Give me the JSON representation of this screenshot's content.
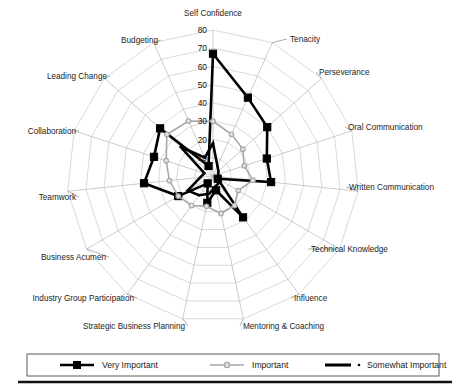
{
  "chart_data": {
    "type": "radar",
    "title": "",
    "categories": [
      "Self Confidence",
      "Tenacity",
      "Perseverance",
      "Oral Communication",
      "Written Communication",
      "Technical Knowledge",
      "Influence",
      "Mentoring & Coaching",
      "Strategic Business Planning",
      "Industry Group Participation",
      "Business Acumen",
      "Teamwork",
      "Collaboration",
      "Leading Change",
      "Budgeting"
    ],
    "ylim": [
      0,
      80
    ],
    "tick_labels": [
      "80",
      "70",
      "60",
      "50",
      "40",
      "30",
      "20",
      "10"
    ],
    "tick_values": [
      80,
      70,
      60,
      50,
      40,
      30,
      20,
      10
    ],
    "grid": true,
    "legend_position": "bottom",
    "series": [
      {
        "name": "Very Important",
        "color": "#000000",
        "marker": "square",
        "values": [
          67,
          47,
          40,
          31,
          32,
          3,
          28,
          8,
          15,
          5,
          22,
          38,
          34,
          39,
          6
        ]
      },
      {
        "name": "Important",
        "color": "#a8a8a8",
        "marker": "circle",
        "values": [
          30,
          25,
          22,
          18,
          22,
          16,
          20,
          21,
          17,
          20,
          22,
          24,
          27,
          34,
          33
        ]
      },
      {
        "name": "Somewhat Important",
        "color": "#000000",
        "marker": "dot",
        "values": [
          18,
          6,
          4,
          3,
          3,
          4,
          5,
          6,
          10,
          13,
          16,
          7,
          5,
          24,
          11
        ]
      }
    ]
  },
  "legend": {
    "items": [
      {
        "label": "Very Important",
        "color": "#000000",
        "marker": "square"
      },
      {
        "label": "Important",
        "color": "#a8a8a8",
        "marker": "circle"
      },
      {
        "label": "Somewhat Important",
        "color": "#000000",
        "marker": "dot"
      }
    ]
  }
}
